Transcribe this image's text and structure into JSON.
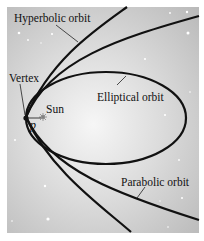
{
  "diagram": {
    "type": "orbits-conic-sections",
    "labels": {
      "hyperbolic": "Hyperbolic orbit",
      "elliptical": "Elliptical orbit",
      "parabolic": "Parabolic orbit",
      "vertex": "Vertex",
      "sun": "Sun",
      "point": "p"
    },
    "colors": {
      "background_center": "#f6f6f6",
      "background_edge": "#b9b9b9",
      "curve": "#111111",
      "star": "#ffffff"
    }
  }
}
